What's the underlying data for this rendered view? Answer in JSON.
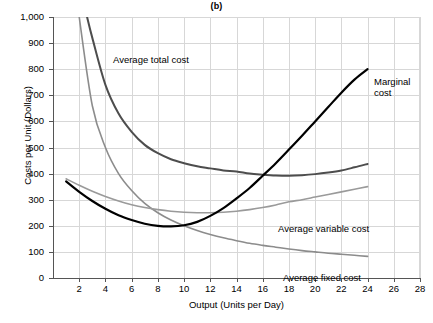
{
  "chart_data": {
    "type": "line",
    "title": "(b)",
    "xlabel": "Output (Units per Day)",
    "ylabel": "Costs per Unit (Dollars)",
    "xlim": [
      0,
      28
    ],
    "ylim": [
      0,
      1000
    ],
    "xticks": [
      2,
      4,
      6,
      8,
      10,
      12,
      14,
      16,
      18,
      20,
      22,
      24,
      26,
      28
    ],
    "yticks": [
      0,
      100,
      200,
      300,
      400,
      500,
      600,
      700,
      800,
      900,
      1000
    ],
    "ytick_labels": [
      "0",
      "100",
      "200",
      "300",
      "400",
      "500",
      "600",
      "700",
      "800",
      "900",
      "1,000"
    ],
    "grid": true,
    "legend_position": "inline-annotations",
    "series": [
      {
        "name": "Average fixed cost",
        "color": "#8c8c8c",
        "x": [
          1.5,
          2,
          3,
          4,
          5,
          6,
          7,
          8,
          9,
          10,
          11,
          12,
          13,
          14,
          15,
          16,
          17,
          18,
          19,
          20,
          21,
          22,
          23,
          24
        ],
        "values": [
          1200,
          1000,
          660,
          500,
          400,
          335,
          286,
          250,
          222,
          200,
          182,
          167,
          154,
          143,
          133,
          125,
          118,
          111,
          105,
          100,
          95,
          91,
          87,
          83
        ]
      },
      {
        "name": "Average variable cost",
        "color": "#9a9a9a",
        "x": [
          1,
          2,
          3,
          4,
          5,
          6,
          7,
          8,
          9,
          10,
          11,
          12,
          13,
          14,
          15,
          16,
          17,
          18,
          19,
          20,
          21,
          22,
          23,
          24
        ],
        "values": [
          380,
          355,
          332,
          312,
          295,
          281,
          270,
          262,
          256,
          252,
          250,
          250,
          252,
          256,
          262,
          270,
          280,
          292,
          300,
          310,
          320,
          330,
          340,
          350
        ]
      },
      {
        "name": "Average total cost",
        "color": "#4d4d4d",
        "x": [
          2.6,
          3,
          4,
          5,
          6,
          7,
          8,
          9,
          10,
          11,
          12,
          13,
          14,
          15,
          16,
          17,
          18,
          19,
          20,
          21,
          22,
          23,
          24
        ],
        "values": [
          1000,
          920,
          740,
          630,
          560,
          510,
          478,
          455,
          440,
          428,
          420,
          412,
          408,
          400,
          396,
          393,
          392,
          394,
          398,
          404,
          412,
          424,
          437
        ]
      },
      {
        "name": "Marginal cost",
        "color": "#000000",
        "x": [
          1,
          2,
          3,
          4,
          5,
          6,
          7,
          8,
          9,
          10,
          11,
          12,
          13,
          14,
          15,
          16,
          17,
          18,
          19,
          20,
          21,
          22,
          23,
          24
        ],
        "values": [
          370,
          330,
          295,
          265,
          240,
          222,
          208,
          200,
          198,
          202,
          215,
          238,
          268,
          305,
          345,
          392,
          440,
          492,
          545,
          600,
          655,
          710,
          760,
          800
        ]
      }
    ],
    "annotations": [
      {
        "text": "Average total cost",
        "x_px": 113,
        "y_px": 54
      },
      {
        "text": "Marginal cost",
        "x_px": 374,
        "y_px": 76
      },
      {
        "text": "Average variable cost",
        "x_px": 278,
        "y_px": 223
      },
      {
        "text": "Average fixed cost",
        "x_px": 283,
        "y_px": 272
      }
    ]
  }
}
